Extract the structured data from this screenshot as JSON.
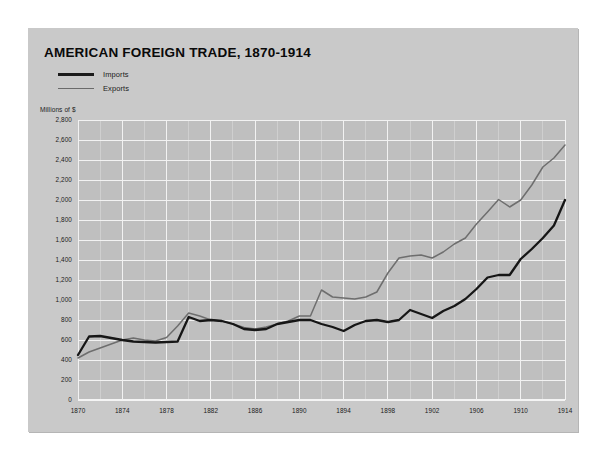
{
  "card": {
    "background_color": "#c9c9c9"
  },
  "chart_data": {
    "type": "line",
    "title": "AMERICAN FOREIGN TRADE, 1870-1914",
    "subtitle": "",
    "xlabel": "",
    "ylabel": "Millions of $",
    "unit_label": "Millions of $",
    "grid": true,
    "legend_position": "top-left",
    "xlim": [
      1870,
      1914
    ],
    "ylim": [
      0,
      2800
    ],
    "ytick_step": 200,
    "xtick_step": 4,
    "x_minor_step": 2,
    "ytick_labels": [
      "0",
      "200",
      "400",
      "600",
      "800",
      "1,000",
      "1,200",
      "1,400",
      "1,600",
      "1,800",
      "2,000",
      "2,200",
      "2,400",
      "2,600",
      "2,800"
    ],
    "ytick_values": [
      0,
      200,
      400,
      600,
      800,
      1000,
      1200,
      1400,
      1600,
      1800,
      2000,
      2200,
      2400,
      2600,
      2800
    ],
    "xtick_labels": [
      "1870",
      "1874",
      "1878",
      "1882",
      "1886",
      "1890",
      "1894",
      "1898",
      "1902",
      "1906",
      "1910",
      "1914"
    ],
    "xtick_values": [
      1870,
      1874,
      1878,
      1882,
      1886,
      1890,
      1894,
      1898,
      1902,
      1906,
      1910,
      1914
    ],
    "x": [
      1870,
      1871,
      1872,
      1873,
      1874,
      1875,
      1876,
      1877,
      1878,
      1879,
      1880,
      1881,
      1882,
      1883,
      1884,
      1885,
      1886,
      1887,
      1888,
      1889,
      1890,
      1891,
      1892,
      1893,
      1894,
      1895,
      1896,
      1897,
      1898,
      1899,
      1900,
      1901,
      1902,
      1903,
      1904,
      1905,
      1906,
      1907,
      1908,
      1909,
      1910,
      1911,
      1912,
      1913,
      1914
    ],
    "series": [
      {
        "name": "Imports",
        "color": "#161616",
        "line_width": "thick",
        "values": [
          450,
          635,
          640,
          620,
          600,
          585,
          580,
          575,
          580,
          585,
          830,
          790,
          800,
          790,
          760,
          710,
          700,
          710,
          760,
          780,
          800,
          800,
          760,
          730,
          690,
          750,
          790,
          800,
          780,
          800,
          900,
          860,
          820,
          890,
          940,
          1010,
          1110,
          1225,
          1250,
          1250,
          1410,
          1510,
          1620,
          1745,
          2000
        ]
      },
      {
        "name": "Exports",
        "color": "#6e6e6e",
        "line_width": "thin",
        "values": [
          420,
          480,
          520,
          560,
          600,
          620,
          600,
          590,
          625,
          740,
          870,
          840,
          800,
          790,
          760,
          725,
          710,
          730,
          760,
          790,
          840,
          840,
          1100,
          1030,
          1020,
          1010,
          1030,
          1080,
          1270,
          1420,
          1440,
          1450,
          1420,
          1480,
          1560,
          1620,
          1760,
          1880,
          2005,
          1930,
          2000,
          2150,
          2330,
          2420,
          2550
        ]
      }
    ]
  }
}
